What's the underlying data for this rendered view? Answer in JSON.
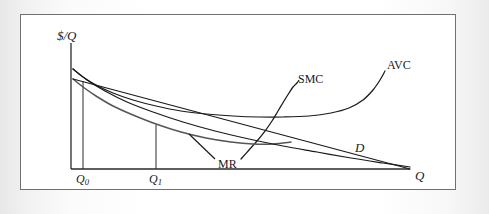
{
  "figure": {
    "kind": "economics-cost-and-revenue-diagram",
    "background_color": "#ffffff",
    "page_color": "#ececed",
    "frame_border_color": "#6f7072",
    "curve_color": "#1a1a1a",
    "axis_color": "#2a2a2a",
    "mr_curve_color": "#555555"
  },
  "axes": {
    "y_axis_label": "$/Q",
    "x_axis_label": "Q",
    "x_tick_labels": [
      {
        "base": "Q",
        "subscript": "0"
      },
      {
        "base": "Q",
        "subscript": "1"
      }
    ],
    "y_axis_x": 70,
    "y_axis_top": 42,
    "x_axis_y": 168,
    "x_axis_right": 409
  },
  "curve_labels": {
    "avc": "AVC",
    "smc": "SMC",
    "mr": "MR",
    "demand": "D",
    "quantity": "Q"
  },
  "chart_data": {
    "type": "line",
    "title": "",
    "xlabel": "Q",
    "ylabel": "$/Q",
    "grid": false,
    "legend": "inline-curve-labels",
    "xlim": [
      70,
      409
    ],
    "ylim": [
      168,
      42
    ],
    "note": "Coordinates are pixel positions inside the 436x176 figure frame; y increases downward.",
    "series": [
      {
        "name": "AVC",
        "label": "AVC",
        "type": "u-shaped-average-variable-cost",
        "color": "#1a1a1a",
        "points": [
          [
            72,
            68
          ],
          [
            82,
            76
          ],
          [
            95,
            84
          ],
          [
            112,
            92
          ],
          [
            132,
            99
          ],
          [
            155,
            105
          ],
          [
            180,
            110
          ],
          [
            205,
            113
          ],
          [
            232,
            115
          ],
          [
            258,
            116
          ],
          [
            283,
            116
          ],
          [
            308,
            115
          ],
          [
            330,
            112
          ],
          [
            348,
            107
          ],
          [
            362,
            99
          ],
          [
            372,
            89
          ],
          [
            379,
            79
          ],
          [
            384,
            70
          ]
        ],
        "label_position": [
          386,
          66
        ]
      },
      {
        "name": "SMC",
        "label": "SMC",
        "type": "rising-short-run-marginal-cost",
        "color": "#1a1a1a",
        "points": [
          [
            240,
            158
          ],
          [
            248,
            149
          ],
          [
            256,
            140
          ],
          [
            264,
            130
          ],
          [
            271,
            120
          ],
          [
            277,
            110
          ],
          [
            283,
            100
          ],
          [
            288,
            92
          ],
          [
            292,
            86
          ],
          [
            296,
            82
          ]
        ],
        "label_position": [
          299,
          80
        ]
      },
      {
        "name": "MR",
        "label": "MR",
        "type": "marginal-revenue-curve",
        "color": "#555555",
        "points": [
          [
            72,
            78
          ],
          [
            82,
            86
          ],
          [
            95,
            95
          ],
          [
            112,
            105
          ],
          [
            132,
            114
          ],
          [
            155,
            123
          ],
          [
            180,
            131
          ],
          [
            205,
            137
          ],
          [
            230,
            141
          ],
          [
            252,
            143
          ],
          [
            272,
            143
          ],
          [
            290,
            141
          ]
        ],
        "label_position": [
          218,
          160
        ],
        "leader_line": [
          [
            188,
            133
          ],
          [
            214,
            158
          ]
        ]
      },
      {
        "name": "D",
        "label": "D",
        "type": "linear-demand",
        "color": "#1a1a1a",
        "points": [
          [
            72,
            78
          ],
          [
            409,
            168
          ]
        ],
        "label_position": [
          355,
          145
        ]
      },
      {
        "name": "AR-upper-arc",
        "label": "",
        "type": "secondary-arc-from-origin",
        "color": "#1a1a1a",
        "points": [
          [
            72,
            68
          ],
          [
            86,
            79
          ],
          [
            104,
            90
          ],
          [
            126,
            101
          ],
          [
            152,
            111
          ],
          [
            182,
            121
          ],
          [
            214,
            130
          ],
          [
            248,
            138
          ],
          [
            282,
            145
          ],
          [
            316,
            151
          ],
          [
            350,
            157
          ],
          [
            382,
            162
          ],
          [
            409,
            166
          ]
        ]
      }
    ],
    "vertical_drop_lines": [
      {
        "label": "Q0",
        "x": 82,
        "y_top": 80,
        "y_bottom": 168
      },
      {
        "label": "Q1",
        "x": 155,
        "y_top": 124,
        "y_bottom": 168
      }
    ]
  }
}
